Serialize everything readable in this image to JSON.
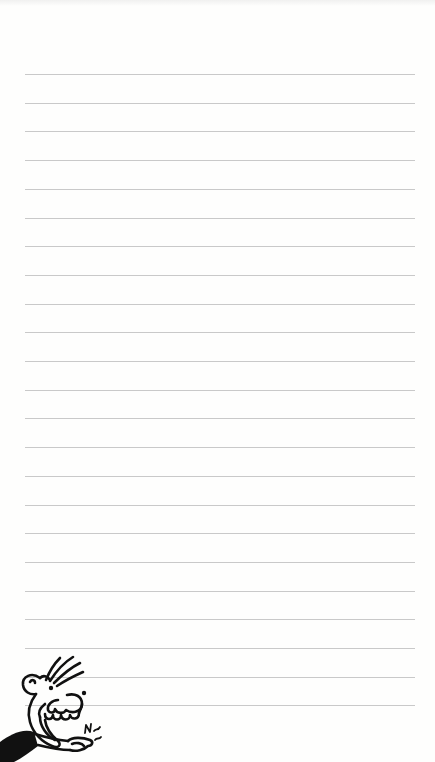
{
  "page": {
    "type": "lined-notebook-page",
    "background_color": "#fefefd",
    "rule_color": "#c9c9c9",
    "rule_count": 23,
    "rule_first_y": 74,
    "rule_spacing": 28.7,
    "rule_left": 25,
    "rule_right": 415
  },
  "illustration": {
    "subject": "cartoon-boy-grinning-snapping-fingers",
    "position": "bottom-left",
    "ink_color": "#111111",
    "sound_effect_text": "N"
  }
}
